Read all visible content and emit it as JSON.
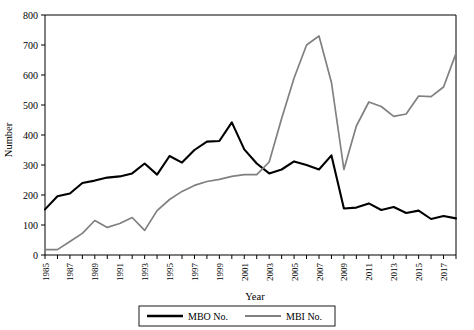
{
  "chart_data": {
    "type": "line",
    "title": "",
    "xlabel": "Year",
    "ylabel": "Number",
    "xlim": [
      1985,
      2018
    ],
    "ylim": [
      0,
      800
    ],
    "ytick_labels": [
      "0",
      "100",
      "200",
      "300",
      "400",
      "500",
      "600",
      "700",
      "800"
    ],
    "ytick_values": [
      0,
      100,
      200,
      300,
      400,
      500,
      600,
      700,
      800
    ],
    "xtick_labels": [
      "1985",
      "1987",
      "1989",
      "1991",
      "1993",
      "1995",
      "1997",
      "1999",
      "2001",
      "2003",
      "2005",
      "2007",
      "2009",
      "2011",
      "2013",
      "2015",
      "2017"
    ],
    "xtick_values": [
      1985,
      1987,
      1989,
      1991,
      1993,
      1995,
      1997,
      1999,
      2001,
      2003,
      2005,
      2007,
      2009,
      2011,
      2013,
      2015,
      2017
    ],
    "x": [
      1985,
      1986,
      1987,
      1988,
      1989,
      1990,
      1991,
      1992,
      1993,
      1994,
      1995,
      1996,
      1997,
      1998,
      1999,
      2000,
      2001,
      2002,
      2003,
      2004,
      2005,
      2006,
      2007,
      2008,
      2009,
      2010,
      2011,
      2012,
      2013,
      2014,
      2015,
      2016,
      2017,
      2018
    ],
    "grid": false,
    "legend_position": "bottom",
    "series": [
      {
        "name": "MBO No.",
        "color": "#000000",
        "values": [
          152,
          196,
          205,
          240,
          248,
          258,
          262,
          272,
          305,
          268,
          330,
          308,
          350,
          378,
          380,
          442,
          352,
          305,
          272,
          285,
          312,
          300,
          285,
          332,
          155,
          158,
          172,
          150,
          160,
          140,
          148,
          120,
          130,
          122
        ]
      },
      {
        "name": "MBI No.",
        "color": "#808080",
        "values": [
          18,
          18,
          45,
          72,
          115,
          92,
          105,
          125,
          82,
          148,
          185,
          212,
          232,
          245,
          252,
          262,
          268,
          268,
          310,
          455,
          590,
          700,
          730,
          575,
          285,
          430,
          510,
          495,
          462,
          470,
          530,
          528,
          560,
          672
        ]
      }
    ]
  },
  "legend": {
    "items": [
      {
        "label": "MBO No.",
        "color": "#000000"
      },
      {
        "label": "MBI No.",
        "color": "#808080"
      }
    ]
  }
}
